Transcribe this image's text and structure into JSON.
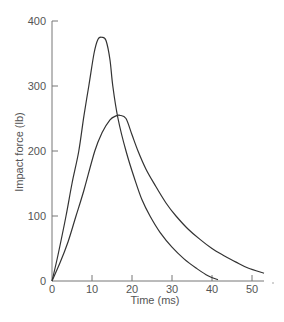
{
  "chart_data": {
    "type": "line",
    "title": "",
    "xlabel": "Time (ms)",
    "ylabel": "Impact force (lb)",
    "xlim": [
      0,
      53
    ],
    "ylim": [
      0,
      400
    ],
    "xticks": [
      0,
      10,
      20,
      30,
      40,
      50
    ],
    "yticks": [
      0,
      100,
      200,
      300,
      400
    ],
    "grid": false,
    "legend": null,
    "series": [
      {
        "name": "Curve A (higher, shorter pulse)",
        "x": [
          0,
          1.5,
          3.5,
          5,
          6.7,
          8,
          9.2,
          10.5,
          11.5,
          12.5,
          13.5,
          14.5,
          15.2,
          16.5,
          18.5,
          20.5,
          22.5,
          24.5,
          27,
          30,
          33,
          36,
          39,
          41.5
        ],
        "y": [
          0,
          40,
          100,
          150,
          200,
          255,
          300,
          350,
          372,
          375,
          370,
          340,
          300,
          250,
          200,
          160,
          125,
          100,
          75,
          52,
          34,
          20,
          8,
          2
        ]
      },
      {
        "name": "Curve B (lower, longer pulse)",
        "x": [
          0,
          2,
          4,
          6,
          8,
          10.7,
          12.5,
          14.5,
          16,
          17,
          18.5,
          20,
          21.5,
          23.5,
          26,
          28.5,
          31,
          34,
          37,
          40,
          43,
          46,
          49,
          53
        ],
        "y": [
          0,
          28,
          60,
          100,
          140,
          200,
          228,
          248,
          254,
          255,
          250,
          225,
          200,
          172,
          145,
          120,
          100,
          80,
          64,
          50,
          39,
          29,
          20,
          12
        ]
      }
    ]
  },
  "axes": {
    "x_title": "Time (ms)",
    "y_title": "Impact force (lb)",
    "x_tick_labels": [
      "0",
      "10",
      "20",
      "30",
      "40",
      "50"
    ],
    "y_tick_labels": [
      "0",
      "100",
      "200",
      "300",
      "400"
    ]
  }
}
